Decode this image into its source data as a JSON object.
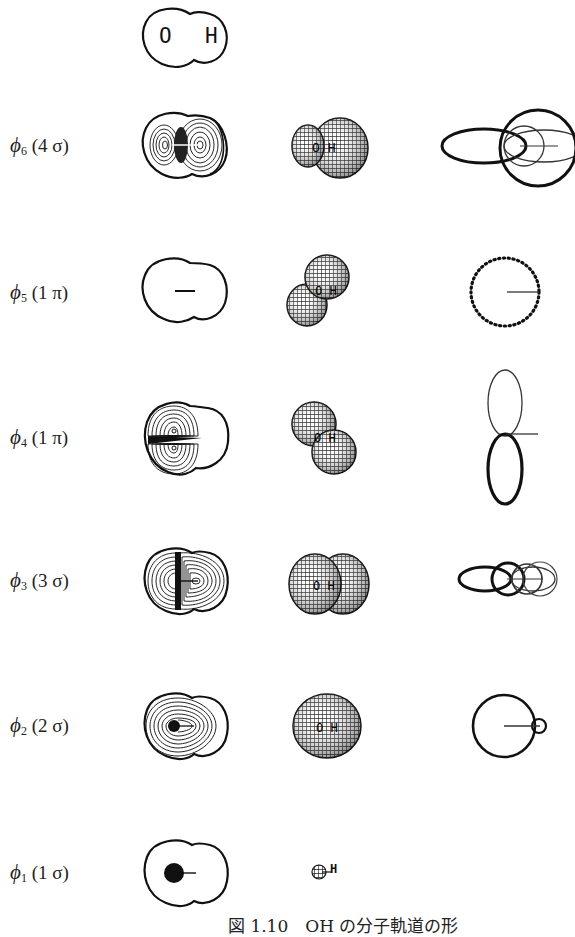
{
  "header": {
    "diagram_title": "O H",
    "atom_o": "O",
    "atom_h": "H"
  },
  "columns": [
    "contour map",
    "3D surface",
    "orbital components"
  ],
  "rows": [
    {
      "id": "phi6",
      "phi": "ϕ",
      "index": "6",
      "num": "4",
      "sym": "σ",
      "y": 145
    },
    {
      "id": "phi5",
      "phi": "ϕ",
      "index": "5",
      "num": "1",
      "sym": "π",
      "y": 290
    },
    {
      "id": "phi4",
      "phi": "ϕ",
      "index": "4",
      "num": "1",
      "sym": "π",
      "y": 440
    },
    {
      "id": "phi3",
      "phi": "ϕ",
      "index": "3",
      "num": "3",
      "sym": "σ",
      "y": 580
    },
    {
      "id": "phi2",
      "phi": "ϕ",
      "index": "2",
      "num": "2",
      "sym": "σ",
      "y": 725
    },
    {
      "id": "phi1",
      "phi": "ϕ",
      "index": "1",
      "num": "1",
      "sym": "σ",
      "y": 872
    }
  ],
  "row_labels": {
    "phi6": {
      "phi": "ϕ",
      "index": "6",
      "paren": "(4 σ)"
    },
    "phi5": {
      "phi": "ϕ",
      "index": "5",
      "paren": "(1 π)"
    },
    "phi4": {
      "phi": "ϕ",
      "index": "4",
      "paren": "(1 π)"
    },
    "phi3": {
      "phi": "ϕ",
      "index": "3",
      "paren": "(3 σ)"
    },
    "phi2": {
      "phi": "ϕ",
      "index": "2",
      "paren": "(2 σ)"
    },
    "phi1": {
      "phi": "ϕ",
      "index": "1",
      "paren": "(1 σ)"
    }
  },
  "small_label_h": "H",
  "caption": "図 1.10　OH の分子軌道の形",
  "colors": {
    "ink": "#111111",
    "background": "#ffffff"
  }
}
